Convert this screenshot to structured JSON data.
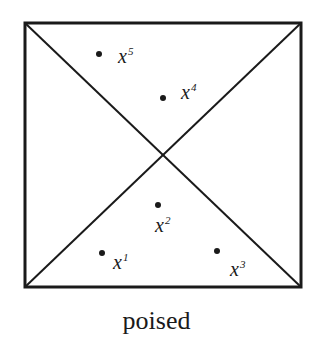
{
  "figure": {
    "caption": "poised",
    "square": {
      "x1": 25,
      "y1": 23,
      "x2": 301,
      "y2": 287,
      "stroke": "#1a1a1a"
    },
    "points": [
      {
        "name": "x",
        "sup": "1",
        "dot": [
          102,
          253
        ],
        "label": [
          113,
          269
        ]
      },
      {
        "name": "x",
        "sup": "2",
        "dot": [
          158,
          205
        ],
        "label": [
          155,
          232
        ]
      },
      {
        "name": "x",
        "sup": "3",
        "dot": [
          217,
          251
        ],
        "label": [
          230,
          276
        ]
      },
      {
        "name": "x",
        "sup": "4",
        "dot": [
          163,
          98
        ],
        "label": [
          181,
          99
        ]
      },
      {
        "name": "x",
        "sup": "5",
        "dot": [
          99,
          54
        ],
        "label": [
          118,
          63
        ]
      }
    ]
  }
}
